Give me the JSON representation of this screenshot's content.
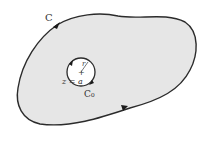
{
  "diagram": {
    "type": "contour-integration",
    "outer_contour": {
      "label": "C",
      "fill": "#e6e6e6",
      "stroke": "#2b2b2b",
      "direction": "counterclockwise"
    },
    "inner_contour": {
      "label": "C₀",
      "center_label": "z = a",
      "radius_label": "r",
      "fill": "#ffffff",
      "stroke": "#2b2b2b",
      "direction": "clockwise"
    },
    "center_marker": "+"
  }
}
